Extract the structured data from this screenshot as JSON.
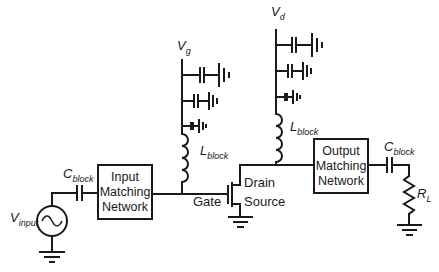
{
  "diagram": {
    "type": "RF amplifier biasing circuit schematic",
    "input_network": {
      "source_label": "V",
      "source_subscript": "input",
      "capacitor_label": "C",
      "capacitor_subscript": "block",
      "box_lines": [
        "Input",
        "Matching",
        "Network"
      ]
    },
    "gate_bias": {
      "supply_label": "V",
      "supply_subscript": "g",
      "inductor_label": "L",
      "inductor_subscript": "block"
    },
    "drain_bias": {
      "supply_label": "V",
      "supply_subscript": "d",
      "inductor_label": "L",
      "inductor_subscript": "block"
    },
    "transistor": {
      "gate_label": "Gate",
      "drain_label": "Drain",
      "source_label": "Source"
    },
    "output_network": {
      "box_lines": [
        "Output",
        "Matching",
        "Network"
      ],
      "capacitor_label": "C",
      "capacitor_subscript": "block",
      "load_label": "R",
      "load_subscript": "L"
    },
    "colors": {
      "stroke": "#1a1a1a",
      "background": "#ffffff"
    }
  }
}
